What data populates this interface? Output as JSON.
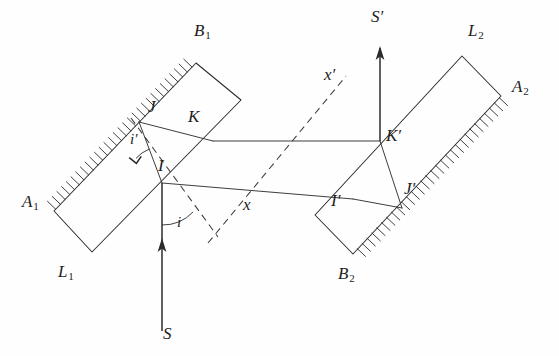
{
  "figure": {
    "type": "optics-ray-diagram",
    "background_color": "#fefefe",
    "line_color": "#2b2b2b",
    "width": 559,
    "height": 356
  },
  "labels": {
    "A1": {
      "text": "A",
      "sub": "1",
      "x": 22,
      "y": 193
    },
    "B1": {
      "text": "B",
      "sub": "1",
      "x": 194,
      "y": 22
    },
    "L1": {
      "text": "L",
      "sub": "1",
      "x": 58,
      "y": 263
    },
    "A2": {
      "text": "A",
      "sub": "2",
      "x": 512,
      "y": 78
    },
    "B2": {
      "text": "B",
      "sub": "2",
      "x": 338,
      "y": 265
    },
    "L2": {
      "text": "L",
      "sub": "2",
      "x": 468,
      "y": 22
    },
    "I": {
      "text": "I",
      "x": 158,
      "y": 157
    },
    "J": {
      "text": "J",
      "x": 148,
      "y": 98
    },
    "K": {
      "text": "K",
      "x": 188,
      "y": 108
    },
    "I_prime": {
      "text": "I′",
      "x": 331,
      "y": 192
    },
    "J_prime": {
      "text": "J′",
      "x": 404,
      "y": 180
    },
    "K_prime": {
      "text": "K′",
      "x": 386,
      "y": 127
    },
    "S": {
      "text": "S",
      "x": 163,
      "y": 325
    },
    "S_prime": {
      "text": "S′",
      "x": 371,
      "y": 8
    },
    "x": {
      "text": "x",
      "x": 243,
      "y": 196
    },
    "x_prime": {
      "text": "x′",
      "x": 324,
      "y": 66
    },
    "i_incident": {
      "text": "i",
      "x": 177,
      "y": 215
    },
    "i_prime_refracted": {
      "text": "i′",
      "x": 130,
      "y": 132
    }
  },
  "geometry": {
    "plate1": {
      "name": "left-plate",
      "corner_A1": [
        54,
        211
      ],
      "corner_B1": [
        196,
        63
      ],
      "corner_right": [
        241,
        100
      ],
      "corner_L1": [
        92,
        252
      ],
      "hatched_edge": "A1-B1",
      "hatch_count": 30
    },
    "plate2": {
      "name": "right-plate",
      "corner_L2": [
        462,
        56
      ],
      "corner_A2": [
        501,
        96
      ],
      "corner_B2": [
        353,
        254
      ],
      "corner_left": [
        315,
        215
      ],
      "hatched_edge": "A2-B2",
      "hatch_count": 30
    },
    "points": {
      "I": [
        162,
        183
      ],
      "J": [
        139,
        122
      ],
      "K": [
        213,
        141
      ],
      "I_prime": [
        353,
        199
      ],
      "J_prime": [
        402,
        208
      ],
      "K_prime": [
        380,
        141
      ]
    },
    "rays": {
      "incident_S_to_I": [
        [
          162,
          330
        ],
        [
          162,
          183
        ]
      ],
      "internal_I_to_J": [
        [
          162,
          183
        ],
        [
          139,
          122
        ]
      ],
      "internal_J_to_K": [
        [
          139,
          122
        ],
        [
          213,
          141
        ]
      ],
      "upper_K_to_Kprime": [
        [
          213,
          141
        ],
        [
          380,
          141
        ]
      ],
      "lower_I_to_Iprime": [
        [
          162,
          183
        ],
        [
          353,
          199
        ]
      ],
      "internal_Iprime_to_Jprime": [
        [
          353,
          199
        ],
        [
          402,
          208
        ]
      ],
      "internal_Jprime_to_Kprime": [
        [
          402,
          208
        ],
        [
          380,
          141
        ]
      ],
      "exit_Kprime_to_Sprime": [
        [
          380,
          141
        ],
        [
          380,
          47
        ]
      ]
    },
    "dashed_lines": {
      "normal_through_I": [
        [
          131,
          118
        ],
        [
          218,
          237
        ]
      ],
      "x_axis_dashed": [
        [
          212,
          237
        ],
        [
          344,
          78
        ]
      ]
    },
    "arrows": {
      "S_up": {
        "from": [
          162,
          330
        ],
        "to": [
          162,
          240
        ],
        "direction": "up"
      },
      "S_prime_up": {
        "from": [
          380,
          141
        ],
        "to": [
          380,
          47
        ],
        "direction": "up"
      }
    }
  },
  "annotations": {
    "angle_i": {
      "label": "i",
      "vertex": "I",
      "radius": 40,
      "description": "angle of incidence between normal and incident ray"
    },
    "angle_i_prime": {
      "label": "i′",
      "vertex": "I",
      "radius": 34,
      "description": "angle of refraction inside plate"
    },
    "right_angle_marker": {
      "vertex": "I",
      "description": "perpendicular mark at surface normal"
    }
  }
}
